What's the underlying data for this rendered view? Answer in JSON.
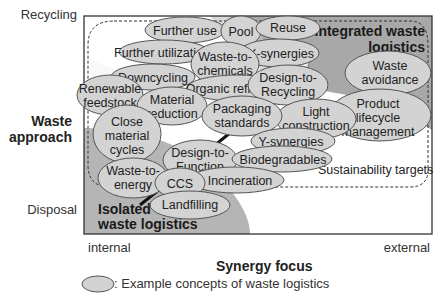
{
  "y_axis": {
    "title": "Waste approach",
    "title_lines": [
      "Waste",
      "approach"
    ],
    "top_label": "Recycling",
    "bottom_label": "Disposal"
  },
  "x_axis": {
    "title": "Synergy focus",
    "left_label": "internal",
    "right_label": "external"
  },
  "regions": {
    "integrated": {
      "label": "Integrated waste logistics",
      "lines": [
        "Integrated waste",
        "logistics"
      ]
    },
    "isolated": {
      "label": "Isolated waste logistics",
      "lines": [
        "Isolated",
        "waste logistics"
      ]
    },
    "sustainability": {
      "label": "Sustainability targets"
    }
  },
  "concepts": [
    {
      "id": "further-use",
      "lines": [
        "Further use"
      ]
    },
    {
      "id": "pool",
      "lines": [
        "Pool"
      ]
    },
    {
      "id": "reuse",
      "lines": [
        "Reuse"
      ]
    },
    {
      "id": "further-utilization",
      "lines": [
        "Further utilization"
      ]
    },
    {
      "id": "waste-to-chemicals",
      "lines": [
        "Waste-to-",
        "chemicals"
      ]
    },
    {
      "id": "x-synergies",
      "lines": [
        "X-synergies"
      ]
    },
    {
      "id": "downcycling",
      "lines": [
        "Downcycling"
      ]
    },
    {
      "id": "organic-refineries",
      "lines": [
        "Organic refineries"
      ]
    },
    {
      "id": "design-to-recycling",
      "lines": [
        "Design-to-",
        "Recycling"
      ]
    },
    {
      "id": "waste-avoidance",
      "lines": [
        "Waste",
        "avoidance"
      ]
    },
    {
      "id": "renewable-feedstock",
      "lines": [
        "Renewable",
        "feedstock"
      ]
    },
    {
      "id": "material-reduction",
      "lines": [
        "Material",
        "reduction"
      ]
    },
    {
      "id": "packaging-standards",
      "lines": [
        "Packaging",
        "standards"
      ]
    },
    {
      "id": "light-construction",
      "lines": [
        "Light",
        "construction"
      ]
    },
    {
      "id": "product-lifecycle-management",
      "lines": [
        "Product",
        "lifecycle",
        "management"
      ]
    },
    {
      "id": "close-material-cycles",
      "lines": [
        "Close",
        "material",
        "cycles"
      ]
    },
    {
      "id": "y-synergies",
      "lines": [
        "Y-synergies"
      ]
    },
    {
      "id": "design-to-function",
      "lines": [
        "Design-to-",
        "Function"
      ]
    },
    {
      "id": "biodegradables",
      "lines": [
        "Biodegradables"
      ]
    },
    {
      "id": "waste-to-energy",
      "lines": [
        "Waste-to-",
        "energy"
      ]
    },
    {
      "id": "ccs",
      "lines": [
        "CCS"
      ]
    },
    {
      "id": "incineration",
      "lines": [
        "Incineration"
      ]
    },
    {
      "id": "landfilling",
      "lines": [
        "Landfilling"
      ]
    }
  ],
  "legend": {
    "symbol": "ellipse",
    "text": ": Example concepts of waste logistics"
  },
  "colors": {
    "ellipse_fill": "#d4d4d4",
    "ellipse_stroke": "#555555",
    "region_dark": "#a9a9a9",
    "region_mid": "#c4c4c4",
    "frame": "#333333"
  }
}
